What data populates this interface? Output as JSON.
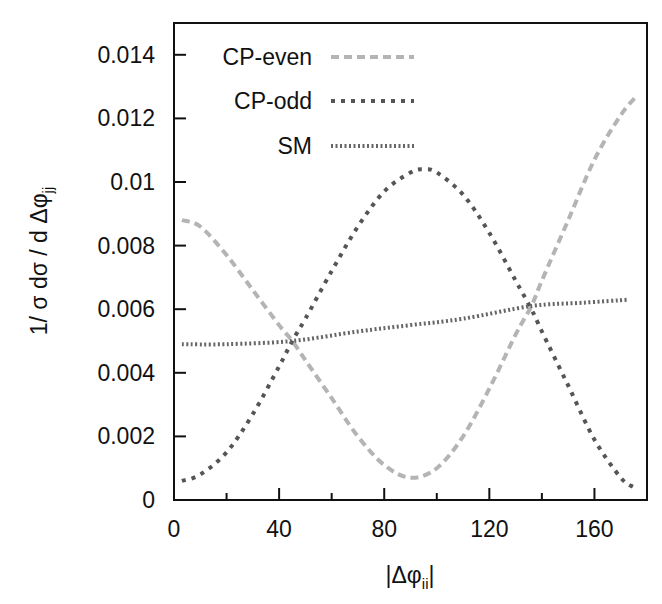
{
  "chart_data": {
    "type": "line",
    "title": "",
    "xlabel": "|Δφii|",
    "xlabel_main": "|Δφ",
    "xlabel_sub": "ii",
    "xlabel_close": "|",
    "ylabel": "1/ σ dσ / d Δφjj",
    "ylabel_main": "1/ σ dσ / d Δφ",
    "ylabel_sub": "jj",
    "xlim": [
      0,
      180
    ],
    "ylim": [
      0,
      0.015
    ],
    "x_ticks": [
      0,
      40,
      80,
      120,
      160
    ],
    "x_tick_labels": [
      "0",
      "40",
      "80",
      "120",
      "160"
    ],
    "x_minor_ticks": [
      20,
      60,
      100,
      140
    ],
    "y_ticks": [
      0,
      0.002,
      0.004,
      0.006,
      0.008,
      0.01,
      0.012,
      0.014
    ],
    "y_tick_labels": [
      "0",
      "0.002",
      "0.004",
      "0.006",
      "0.008",
      "0.01",
      "0.012",
      "0.014"
    ],
    "grid": false,
    "legend_position": "upper-left-inside",
    "series": [
      {
        "name": "CP-even",
        "color": "#b4b4b4",
        "dash": "8,5",
        "width": 4,
        "x": [
          3,
          10,
          20,
          30,
          40,
          45,
          50,
          60,
          70,
          80,
          90,
          100,
          110,
          120,
          130,
          136,
          140,
          150,
          160,
          170,
          176
        ],
        "values": [
          0.0088,
          0.0086,
          0.0077,
          0.0066,
          0.0055,
          0.005,
          0.0044,
          0.0032,
          0.002,
          0.0011,
          0.0007,
          0.001,
          0.002,
          0.0035,
          0.0052,
          0.0061,
          0.0069,
          0.0088,
          0.0107,
          0.0121,
          0.0127
        ]
      },
      {
        "name": "CP-odd",
        "color": "#555555",
        "dash": "4,6",
        "width": 4,
        "x": [
          3,
          10,
          20,
          30,
          40,
          45,
          50,
          60,
          70,
          80,
          90,
          95,
          100,
          110,
          120,
          130,
          136,
          140,
          150,
          160,
          170,
          175
        ],
        "values": [
          0.0006,
          0.0008,
          0.0015,
          0.0027,
          0.0042,
          0.005,
          0.0057,
          0.0072,
          0.0086,
          0.0097,
          0.0103,
          0.0104,
          0.0103,
          0.0096,
          0.0084,
          0.0069,
          0.006,
          0.0053,
          0.0036,
          0.0019,
          0.0007,
          0.0004
        ]
      },
      {
        "name": "SM",
        "color": "#666666",
        "dash": "2,2.5",
        "width": 4,
        "x": [
          3,
          20,
          45,
          70,
          90,
          110,
          136,
          155,
          173
        ],
        "values": [
          0.0049,
          0.0049,
          0.005,
          0.0053,
          0.0055,
          0.0057,
          0.0061,
          0.0062,
          0.0063
        ]
      }
    ]
  }
}
